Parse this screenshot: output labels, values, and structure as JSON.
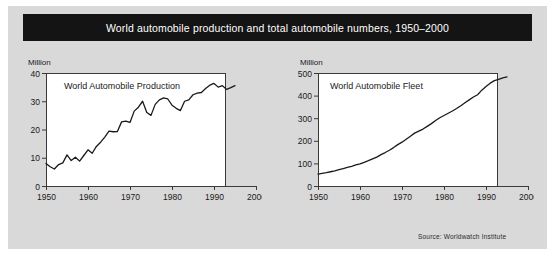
{
  "figure": {
    "title": "World automobile production and total automobile numbers, 1950–2000",
    "source": "Source: Worldwatch Institute",
    "background_color": "#d9d9d9",
    "banner_color": "#141414",
    "banner_text_color": "#ffffff",
    "line_color": "#1a1a1a",
    "plot_background": "#ffffff"
  },
  "chart_data": [
    {
      "type": "line",
      "title": "World Automobile Production",
      "unit_label": "Million",
      "xlabel": "",
      "ylabel": "Million",
      "grid": false,
      "legend_position": "none",
      "xlim": [
        1950,
        2000
      ],
      "ylim": [
        0,
        40
      ],
      "xticks": [
        1950,
        1960,
        1970,
        1980,
        1990,
        2000
      ],
      "yticks": [
        0,
        10,
        20,
        30,
        40
      ],
      "x": [
        1950,
        1951,
        1952,
        1953,
        1954,
        1955,
        1956,
        1957,
        1958,
        1959,
        1960,
        1961,
        1962,
        1963,
        1964,
        1965,
        1966,
        1967,
        1968,
        1969,
        1970,
        1971,
        1972,
        1973,
        1974,
        1975,
        1976,
        1977,
        1978,
        1979,
        1980,
        1981,
        1982,
        1983,
        1984,
        1985,
        1986,
        1987,
        1988,
        1989,
        1990,
        1991,
        1992,
        1993,
        1994,
        1995
      ],
      "values": [
        8.0,
        6.8,
        6.0,
        7.6,
        8.2,
        11.0,
        9.0,
        10.2,
        8.8,
        10.8,
        12.8,
        11.6,
        14.0,
        15.5,
        17.3,
        19.4,
        19.2,
        19.3,
        22.7,
        23.0,
        22.5,
        26.5,
        27.9,
        30.0,
        26.0,
        25.0,
        28.9,
        30.5,
        31.2,
        30.8,
        28.6,
        27.5,
        26.7,
        30.0,
        30.5,
        32.3,
        32.9,
        33.1,
        34.5,
        35.7,
        36.3,
        35.0,
        35.5,
        34.2,
        34.8,
        35.5
      ],
      "annotations": []
    },
    {
      "type": "line",
      "title": "World Automobile Fleet",
      "unit_label": "Million",
      "xlabel": "",
      "ylabel": "Million",
      "grid": false,
      "legend_position": "none",
      "xlim": [
        1950,
        2000
      ],
      "ylim": [
        0,
        500
      ],
      "xticks": [
        1950,
        1960,
        1970,
        1980,
        1990,
        2000
      ],
      "yticks": [
        0,
        100,
        200,
        300,
        400,
        500
      ],
      "x": [
        1950,
        1951,
        1952,
        1953,
        1954,
        1955,
        1956,
        1957,
        1958,
        1959,
        1960,
        1961,
        1962,
        1963,
        1964,
        1965,
        1966,
        1967,
        1968,
        1969,
        1970,
        1971,
        1972,
        1973,
        1974,
        1975,
        1976,
        1977,
        1978,
        1979,
        1980,
        1981,
        1982,
        1983,
        1984,
        1985,
        1986,
        1987,
        1988,
        1989,
        1990,
        1991,
        1992,
        1993,
        1994,
        1995
      ],
      "values": [
        53,
        56,
        59,
        63,
        67,
        72,
        77,
        82,
        87,
        93,
        98,
        105,
        112,
        120,
        128,
        139,
        148,
        158,
        170,
        183,
        194,
        207,
        220,
        234,
        243,
        252,
        264,
        276,
        290,
        302,
        312,
        322,
        332,
        343,
        355,
        368,
        381,
        394,
        404,
        424,
        440,
        455,
        466,
        472,
        478,
        483
      ],
      "annotations": []
    }
  ]
}
